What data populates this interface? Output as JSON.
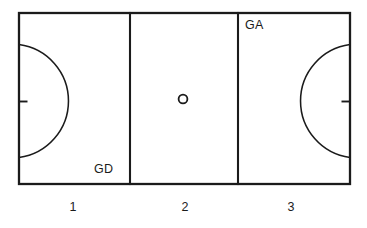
{
  "diagram": {
    "type": "netball-court-diagram",
    "background_color": "#ffffff",
    "line_color": "#1b1b1b",
    "court": {
      "name": "netball-court",
      "x": 19,
      "y": 13,
      "width": 331,
      "height": 171,
      "third_divider_x": [
        130,
        238
      ]
    },
    "position_labels": [
      {
        "id": "gd",
        "text": "GD",
        "third": 1,
        "x": 94,
        "y": 163
      },
      {
        "id": "ga",
        "text": "GA",
        "third": 3,
        "x": 245,
        "y": 19
      }
    ],
    "third_numbers": [
      {
        "id": "1",
        "text": "1",
        "center_x": 73,
        "y": 201
      },
      {
        "id": "2",
        "text": "2",
        "center_x": 185,
        "y": 201
      },
      {
        "id": "3",
        "text": "3",
        "center_x": 291,
        "y": 201
      }
    ],
    "goal_circles": [
      {
        "id": "left-goal-circle",
        "side": "left",
        "center_x": 19,
        "center_y": 101,
        "radius": 57
      },
      {
        "id": "right-goal-circle",
        "side": "right",
        "center_x": 350,
        "center_y": 101,
        "radius": 57
      }
    ],
    "goal_posts": [
      {
        "id": "left-goal-post",
        "side": "left",
        "x": 19,
        "y": 101,
        "length": 8
      },
      {
        "id": "right-goal-post",
        "side": "right",
        "x": 350,
        "y": 101,
        "length": 8
      }
    ],
    "centre_circle": {
      "id": "centre-circle",
      "center_x": 183,
      "center_y": 99,
      "radius": 4.4
    }
  }
}
